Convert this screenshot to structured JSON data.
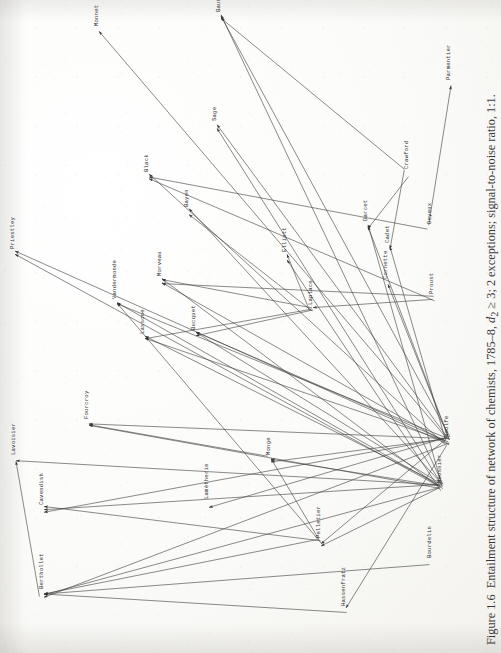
{
  "document": {
    "type": "scanned-book-figure",
    "page_background": "#fdfdfc",
    "ink_color": "#171717"
  },
  "caption": {
    "figure_number": "Figure 1.6",
    "text": "Entailment structure of network of chemists, 1785–8,",
    "math1": "d",
    "math1_sub": "2",
    "math2": " ≥ 3;",
    "tail": " 2 exceptions; signal-to-noise ratio, 1:1.",
    "full": "Figure 1.6  Entailment structure of network of chemists, 1785–8, d₂ ≥ 3; 2 exceptions; signal-to-noise ratio, 1:1."
  },
  "chart_data": {
    "type": "diagram",
    "subtype": "directed-graph",
    "title": "Entailment structure of network of chemists, 1785–8",
    "orientation": "rotated-90-ccw",
    "node_count": 27,
    "nodes": [
      {
        "id": "Monnet",
        "label": "Monnet",
        "x": 93,
        "y": 26
      },
      {
        "id": "Baume",
        "label": "Baumé",
        "x": 215,
        "y": 12
      },
      {
        "id": "Sage",
        "label": "Sage",
        "x": 211,
        "y": 121
      },
      {
        "id": "Black",
        "label": "Black",
        "x": 143,
        "y": 172
      },
      {
        "id": "Bayen",
        "label": "Bayen",
        "x": 183,
        "y": 207
      },
      {
        "id": "Priestley",
        "label": "Priestley",
        "x": 9,
        "y": 249
      },
      {
        "id": "Morveau",
        "label": "Morveau",
        "x": 156,
        "y": 276
      },
      {
        "id": "Elliott",
        "label": "Elliott",
        "x": 281,
        "y": 252
      },
      {
        "id": "Crawford",
        "label": "Crawford",
        "x": 403,
        "y": 169
      },
      {
        "id": "Parmentier",
        "label": "Parmentier",
        "x": 445,
        "y": 80
      },
      {
        "id": "Deyeux",
        "label": "Deyeux",
        "x": 426,
        "y": 224
      },
      {
        "id": "Darcet",
        "label": "Darcet",
        "x": 362,
        "y": 221
      },
      {
        "id": "Cadet",
        "label": "Cadet",
        "x": 384,
        "y": 243
      },
      {
        "id": "Cornette",
        "label": "Cornette",
        "x": 382,
        "y": 279
      },
      {
        "id": "Vandermonde",
        "label": "Vandermonde",
        "x": 111,
        "y": 299
      },
      {
        "id": "Lassone",
        "label": "Lassone",
        "x": 139,
        "y": 334
      },
      {
        "id": "Bucquet",
        "label": "Bucquet",
        "x": 190,
        "y": 330
      },
      {
        "id": "Laplace",
        "label": "Laplace",
        "x": 307,
        "y": 305
      },
      {
        "id": "Proust",
        "label": "Proust",
        "x": 428,
        "y": 294
      },
      {
        "id": "Fourcroy",
        "label": "Fourcroy",
        "x": 83,
        "y": 419
      },
      {
        "id": "Monge",
        "label": "Monge",
        "x": 265,
        "y": 455
      },
      {
        "id": "Lavoisier",
        "label": "Lavoisier",
        "x": 10,
        "y": 455
      },
      {
        "id": "Cavendish",
        "label": "Cavendish",
        "x": 38,
        "y": 505
      },
      {
        "id": "Lametherie",
        "label": "Lamétherie",
        "x": 203,
        "y": 499
      },
      {
        "id": "Woulfe",
        "label": "Woulfe",
        "x": 443,
        "y": 437
      },
      {
        "id": "Meusnier",
        "label": "Meusnier",
        "x": 436,
        "y": 483
      },
      {
        "id": "Pelletier",
        "label": "Pelletier",
        "x": 315,
        "y": 538
      },
      {
        "id": "Bourdelin",
        "label": "Bourdelin",
        "x": 426,
        "y": 558
      },
      {
        "id": "Berthollet",
        "label": "Berthollet",
        "x": 38,
        "y": 589
      },
      {
        "id": "Hassenfratz",
        "label": "Hassenfratz",
        "x": 340,
        "y": 606
      }
    ],
    "edges": [
      [
        "Woulfe",
        "Monnet"
      ],
      [
        "Meusnier",
        "Priestley"
      ],
      [
        "Woulfe",
        "Priestley"
      ],
      [
        "Meusnier",
        "Baume"
      ],
      [
        "Woulfe",
        "Baume"
      ],
      [
        "Crawford",
        "Baume"
      ],
      [
        "Proust",
        "Black"
      ],
      [
        "Deyeux",
        "Black"
      ],
      [
        "Woulfe",
        "Black"
      ],
      [
        "Meusnier",
        "Bayen"
      ],
      [
        "Laplace",
        "Bayen"
      ],
      [
        "Woulfe",
        "Morveau"
      ],
      [
        "Meusnier",
        "Morveau"
      ],
      [
        "Laplace",
        "Morveau"
      ],
      [
        "Proust",
        "Morveau"
      ],
      [
        "Woulfe",
        "Vandermonde"
      ],
      [
        "Meusnier",
        "Vandermonde"
      ],
      [
        "Pelletier",
        "Vandermonde"
      ],
      [
        "Woulfe",
        "Lassone"
      ],
      [
        "Meusnier",
        "Lassone"
      ],
      [
        "Laplace",
        "Lassone"
      ],
      [
        "Woulfe",
        "Bucquet"
      ],
      [
        "Meusnier",
        "Bucquet"
      ],
      [
        "Laplace",
        "Bucquet"
      ],
      [
        "Woulfe",
        "Fourcroy"
      ],
      [
        "Meusnier",
        "Fourcroy"
      ],
      [
        "Monge",
        "Fourcroy"
      ],
      [
        "Woulfe",
        "Monge"
      ],
      [
        "Meusnier",
        "Monge"
      ],
      [
        "Pelletier",
        "Monge"
      ],
      [
        "Meusnier",
        "Lavoisier"
      ],
      [
        "Berthollet",
        "Lavoisier"
      ],
      [
        "Woulfe",
        "Cavendish"
      ],
      [
        "Meusnier",
        "Cavendish"
      ],
      [
        "Pelletier",
        "Cavendish"
      ],
      [
        "Woulfe",
        "Lametherie"
      ],
      [
        "Meusnier",
        "Berthollet"
      ],
      [
        "Woulfe",
        "Berthollet"
      ],
      [
        "Pelletier",
        "Berthollet"
      ],
      [
        "Bourdelin",
        "Berthollet"
      ],
      [
        "Hassenfratz",
        "Berthollet"
      ],
      [
        "Woulfe",
        "Darcet"
      ],
      [
        "Meusnier",
        "Darcet"
      ],
      [
        "Crawford",
        "Darcet"
      ],
      [
        "Woulfe",
        "Cadet"
      ],
      [
        "Crawford",
        "Cadet"
      ],
      [
        "Woulfe",
        "Cornette"
      ],
      [
        "Deyeux",
        "Parmentier"
      ],
      [
        "Meusnier",
        "Elliott"
      ],
      [
        "Laplace",
        "Elliott"
      ],
      [
        "Woulfe",
        "Sage"
      ],
      [
        "Meusnier",
        "Sage"
      ],
      [
        "Woulfe",
        "Pelletier"
      ],
      [
        "Meusnier",
        "Pelletier"
      ],
      [
        "Woulfe",
        "Hassenfratz"
      ],
      [
        "Proust",
        "Laplace"
      ]
    ],
    "legend": null,
    "grid": false
  }
}
